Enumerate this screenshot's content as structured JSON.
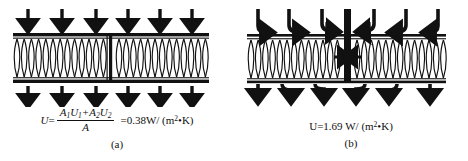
{
  "figure": {
    "background_color": "#ffffff",
    "ink_color": "#111111"
  },
  "panel_a": {
    "label": "(a)",
    "diagram": {
      "name": "uniform-wall-heat-flow",
      "description": "Insulated wall cavity with a thin stud divider; uniform parallel downward heat-flow arrows above and below",
      "arrow_count_top": 6,
      "arrow_count_bottom": 6,
      "arrow_direction": "down",
      "arrow_style": "straight-parallel",
      "insulation_coil_count": 26,
      "plate_color": "#111111",
      "divider_position_pct": 50
    },
    "formula": {
      "lhs_symbol": "U",
      "equals": "=",
      "numerator_terms": [
        "A",
        "1",
        "U",
        "1",
        "A",
        "2",
        "U",
        "2"
      ],
      "numerator_text": "A1U1 +A2U2",
      "denominator_text": "A",
      "numerator_part1_A": "A",
      "numerator_part1_A_sub": "1",
      "numerator_part1_U": "U",
      "numerator_part1_U_sub": "1",
      "plus": "+",
      "numerator_part2_A": "A",
      "numerator_part2_A_sub": "2",
      "numerator_part2_U": "U",
      "numerator_part2_U_sub": "2",
      "denominator": "A",
      "result_equals": "=",
      "result_value": "0.38",
      "result_unit_prefix": "W/",
      "result_unit_open": "(m",
      "result_unit_exp": "2",
      "result_unit_mid": "•K",
      "result_unit_close": ")"
    }
  },
  "panel_b": {
    "label": "(b)",
    "diagram": {
      "name": "thermal-bridge-heat-flow",
      "description": "Insulated wall cavity interrupted by a thick conductive central column; heat-flow arrows converge into the bridge above and fan out below",
      "arrow_count_top": 6,
      "arrow_count_bottom": 6,
      "arrow_direction": "down-converging",
      "arrow_style": "curved-toward-center",
      "insulation_coil_count": 26,
      "plate_color": "#111111",
      "bridge_position_pct": 50,
      "bridge_width_px": 7
    },
    "formula": {
      "lhs_symbol": "U",
      "equals": "=",
      "result_value": "1.69",
      "result_unit_prefix": "W/",
      "result_unit_open": "(m",
      "result_unit_exp": "2",
      "result_unit_mid": "•K",
      "result_unit_close": ")"
    }
  }
}
